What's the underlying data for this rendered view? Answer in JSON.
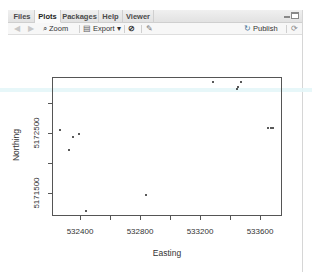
{
  "pane": {
    "tabs": [
      {
        "label": "Files",
        "active": false
      },
      {
        "label": "Plots",
        "active": true
      },
      {
        "label": "Packages",
        "active": false
      },
      {
        "label": "Help",
        "active": false
      },
      {
        "label": "Viewer",
        "active": false
      }
    ],
    "toolbar": {
      "back_icon": "arrow-left-icon",
      "forward_icon": "arrow-right-icon",
      "zoom_label": "Zoom",
      "export_label": "Export",
      "export_caret": "▾",
      "remove_icon": "remove-plot-icon",
      "clear_icon": "broom-icon",
      "publish_label": "Publish",
      "refresh_icon": "refresh-icon"
    }
  },
  "chart_data": {
    "type": "scatter",
    "title": "",
    "xlabel": "Easting",
    "ylabel": "Northing",
    "xlim": [
      532220,
      533750
    ],
    "ylim": [
      5171100,
      5173420
    ],
    "x_ticks": [
      532400,
      532600,
      532800,
      533000,
      533200,
      533400,
      533600
    ],
    "x_tick_labels": [
      "532400",
      "",
      "532800",
      "",
      "533200",
      "",
      "533600"
    ],
    "y_ticks": [
      5171500,
      5172000,
      5172500,
      5173000
    ],
    "y_tick_labels": [
      "5171500",
      "",
      "5172500",
      ""
    ],
    "grid": false,
    "legend": null,
    "points": [
      {
        "x": 532267,
        "y": 5172550
      },
      {
        "x": 532327,
        "y": 5172217
      },
      {
        "x": 532353,
        "y": 5172433
      },
      {
        "x": 532393,
        "y": 5172483
      },
      {
        "x": 532440,
        "y": 5171200
      },
      {
        "x": 532840,
        "y": 5171467
      },
      {
        "x": 533287,
        "y": 5173350
      },
      {
        "x": 533447,
        "y": 5173233
      },
      {
        "x": 533453,
        "y": 5173267
      },
      {
        "x": 533473,
        "y": 5173350
      },
      {
        "x": 533653,
        "y": 5172583
      },
      {
        "x": 533673,
        "y": 5172583
      },
      {
        "x": 533687,
        "y": 5172590
      }
    ]
  }
}
